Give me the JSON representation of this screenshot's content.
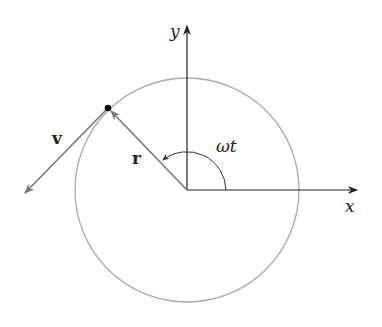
{
  "diagram": {
    "type": "circular-motion",
    "labels": {
      "x_axis": "x",
      "y_axis": "y",
      "position_vector": "r",
      "velocity_vector": "v",
      "angle": "ωt"
    },
    "colors": {
      "axes": "#222222",
      "circle": "#aaaaaa",
      "vectors": "#777777",
      "point": "#111111"
    }
  }
}
